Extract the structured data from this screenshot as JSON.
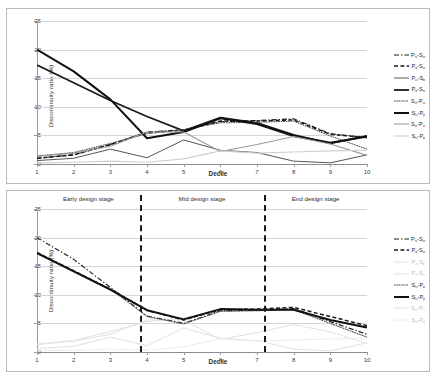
{
  "figure": {
    "panels": [
      "top",
      "bottom"
    ]
  },
  "chart_data": [
    {
      "type": "line",
      "panel": "top",
      "title": "",
      "xlabel": "Decile",
      "ylabel": "Discontinuity ratio (%)",
      "categories": [
        1,
        2,
        3,
        4,
        5,
        6,
        7,
        8,
        9,
        10
      ],
      "xlim": [
        1,
        10
      ],
      "ylim": [
        0,
        25
      ],
      "yticks": [
        0,
        5,
        10,
        15,
        20,
        25
      ],
      "xticks": [
        1,
        2,
        3,
        4,
        5,
        6,
        7,
        8,
        9,
        10
      ],
      "grid": "horizontal",
      "legend_position": "right",
      "series": [
        {
          "name": "Pн-Sн",
          "label_main": "P",
          "label_sub1": "н",
          "label_main2": "S",
          "label_sub2": "н",
          "style": "dash-dot",
          "color": "#1a1a1a",
          "width": 1.1,
          "values": [
            1.0,
            1.6,
            3.4,
            5.6,
            6.0,
            7.4,
            7.6,
            7.9,
            5.3,
            4.6
          ]
        },
        {
          "name": "Pк-Sн",
          "label_main": "P",
          "label_sub1": "к",
          "label_main2": "S",
          "label_sub2": "н",
          "style": "dashed",
          "color": "#1a1a1a",
          "width": 1.5,
          "values": [
            1.0,
            1.6,
            3.4,
            5.5,
            5.9,
            7.5,
            7.5,
            7.7,
            5.2,
            4.6
          ]
        },
        {
          "name": "Pн-Sк",
          "label_main": "P",
          "label_sub1": "н",
          "label_main2": "S",
          "label_sub2": "к",
          "style": "solid",
          "color": "#555555",
          "width": 1.0,
          "values": [
            0.6,
            1.0,
            2.6,
            1.1,
            4.2,
            2.4,
            2.0,
            0.5,
            0.2,
            1.6
          ]
        },
        {
          "name": "Pк-Sн",
          "label_main": "P",
          "label_sub1": "к",
          "label_main2": "S",
          "label_sub2": "н",
          "style": "solid",
          "color": "#1a1a1a",
          "width": 1.8,
          "values": [
            17.3,
            14.2,
            11.1,
            8.3,
            5.8,
            8.1,
            7.2,
            5.1,
            3.6,
            4.9
          ]
        },
        {
          "name": "Sн-Pн",
          "label_main": "S",
          "label_sub1": "н",
          "label_main2": "P",
          "label_sub2": "н",
          "style": "dotted",
          "color": "#4a4a4a",
          "width": 1.0,
          "values": [
            1.4,
            2.0,
            3.6,
            5.3,
            6.0,
            7.2,
            7.3,
            7.5,
            4.9,
            2.6
          ]
        },
        {
          "name": "Sн-Pк",
          "label_main": "S",
          "label_sub1": "н",
          "label_main2": "P",
          "label_sub2": "к",
          "style": "solid",
          "color": "#111111",
          "width": 2.0,
          "values": [
            20.0,
            16.2,
            11.3,
            4.5,
            5.6,
            8.0,
            7.0,
            4.9,
            3.7,
            4.8
          ]
        },
        {
          "name": "Sн-Pн",
          "label_main": "S",
          "label_sub1": "н",
          "label_main2": "P",
          "label_sub2": "н",
          "style": "solid",
          "color": "#9b9b9b",
          "width": 1.1,
          "values": [
            1.3,
            1.9,
            3.1,
            5.6,
            5.6,
            2.2,
            3.4,
            4.8,
            3.5,
            1.5
          ]
        },
        {
          "name": "Sн-Pк",
          "label_main": "S",
          "label_sub1": "н",
          "label_main2": "P",
          "label_sub2": "к",
          "style": "solid",
          "color": "#cfcfcf",
          "width": 1.1,
          "values": [
            0.2,
            0.3,
            0.5,
            0.3,
            0.9,
            2.3,
            1.9,
            2.1,
            2.3,
            2.4
          ]
        }
      ]
    },
    {
      "type": "line",
      "panel": "bottom",
      "title": "",
      "xlabel": "Decile",
      "ylabel": "Discontinuity ratio (%)",
      "categories": [
        1,
        2,
        3,
        4,
        5,
        6,
        7,
        8,
        9,
        10
      ],
      "xlim": [
        1,
        10
      ],
      "ylim": [
        0,
        25
      ],
      "yticks": [
        0,
        5,
        10,
        15,
        20,
        25
      ],
      "xticks": [
        1,
        2,
        3,
        4,
        5,
        6,
        7,
        8,
        9,
        10
      ],
      "grid": "horizontal",
      "legend_position": "right",
      "annotations": [
        {
          "text": "Early design stage",
          "at_x": 2.4
        },
        {
          "text": "Mid design stage",
          "at_x": 5.5
        },
        {
          "text": "End design stage",
          "at_x": 8.6
        }
      ],
      "dividers": [
        3.8,
        7.2
      ],
      "series": [
        {
          "name": "Pн-Sн",
          "label_main": "P",
          "label_sub1": "н",
          "label_main2": "S",
          "label_sub2": "н",
          "style": "dash-dot",
          "color": "#1a1a1a",
          "width": 1.1,
          "emphasis": "on",
          "values": [
            20.0,
            16.2,
            11.3,
            6.3,
            5.0,
            7.2,
            7.3,
            7.6,
            5.3,
            3.1
          ]
        },
        {
          "name": "Pк-Sн",
          "label_main": "P",
          "label_sub1": "к",
          "label_main2": "S",
          "label_sub2": "н",
          "style": "dashed",
          "color": "#1a1a1a",
          "width": 1.5,
          "emphasis": "on",
          "values": [
            17.4,
            14.2,
            11.0,
            7.3,
            5.6,
            7.4,
            7.5,
            7.8,
            6.2,
            4.6
          ]
        },
        {
          "name": "Pн-Sк",
          "label_main": "P",
          "label_sub1": "н",
          "label_main2": "S",
          "label_sub2": "к",
          "style": "solid",
          "color": "#e2e2e2",
          "width": 1.0,
          "emphasis": "off",
          "values": [
            0.6,
            1.0,
            2.6,
            1.1,
            4.2,
            2.4,
            2.0,
            0.5,
            0.2,
            1.6
          ]
        },
        {
          "name": "Pк-Sн",
          "label_main": "P",
          "label_sub1": "к",
          "label_main2": "S",
          "label_sub2": "н",
          "style": "solid",
          "color": "#e2e2e2",
          "width": 1.0,
          "emphasis": "off",
          "values": [
            1.3,
            1.9,
            3.1,
            5.6,
            5.6,
            2.2,
            3.4,
            4.8,
            3.5,
            1.5
          ]
        },
        {
          "name": "Sн-Pк",
          "label_main": "S",
          "label_sub1": "н",
          "label_main2": "P",
          "label_sub2": "к",
          "style": "dotted",
          "color": "#4a4a4a",
          "width": 1.0,
          "emphasis": "on",
          "values": [
            17.4,
            14.2,
            11.0,
            6.2,
            4.9,
            7.1,
            7.2,
            7.4,
            5.0,
            2.6
          ]
        },
        {
          "name": "Sн-Pк",
          "label_main": "S",
          "label_sub1": "н",
          "label_main2": "P",
          "label_sub2": "к",
          "style": "solid",
          "color": "#111111",
          "width": 2.0,
          "emphasis": "on",
          "values": [
            17.3,
            14.1,
            10.9,
            7.3,
            5.7,
            7.5,
            7.4,
            7.4,
            5.6,
            4.3
          ]
        },
        {
          "name": "Sн-Pн",
          "label_main": "S",
          "label_sub1": "н",
          "label_main2": "P",
          "label_sub2": "н",
          "style": "solid",
          "color": "#e2e2e2",
          "width": 1.0,
          "emphasis": "off",
          "values": [
            1.4,
            2.0,
            3.6,
            5.3,
            6.0,
            7.2,
            7.3,
            7.5,
            4.9,
            2.6
          ]
        },
        {
          "name": "Sн-Pк",
          "label_main": "S",
          "label_sub1": "н",
          "label_main2": "P",
          "label_sub2": "к",
          "style": "solid",
          "color": "#ececec",
          "width": 1.0,
          "emphasis": "off",
          "values": [
            0.2,
            0.3,
            0.5,
            0.3,
            0.9,
            2.3,
            1.9,
            2.1,
            2.3,
            2.4
          ]
        }
      ]
    }
  ]
}
